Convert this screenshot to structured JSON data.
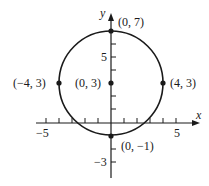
{
  "diagram": {
    "type": "circle-on-coordinate-plane",
    "axes": {
      "x_label": "x",
      "y_label": "y",
      "x_tick_labels": [
        "-5",
        "5"
      ],
      "y_tick_labels": [
        "5",
        "-3"
      ]
    },
    "circle": {
      "center": [
        0,
        3
      ],
      "radius": 4
    },
    "points": [
      {
        "label": "(0, 7)",
        "x": 0,
        "y": 7
      },
      {
        "label": "(-4, 3)",
        "x": -4,
        "y": 3
      },
      {
        "label": "(0, 3)",
        "x": 0,
        "y": 3
      },
      {
        "label": "(4, 3)",
        "x": 4,
        "y": 3
      },
      {
        "label": "(0, -1)",
        "x": 0,
        "y": -1
      }
    ],
    "colors": {
      "ink": "#1a1a1a",
      "background": "#ffffff"
    }
  }
}
